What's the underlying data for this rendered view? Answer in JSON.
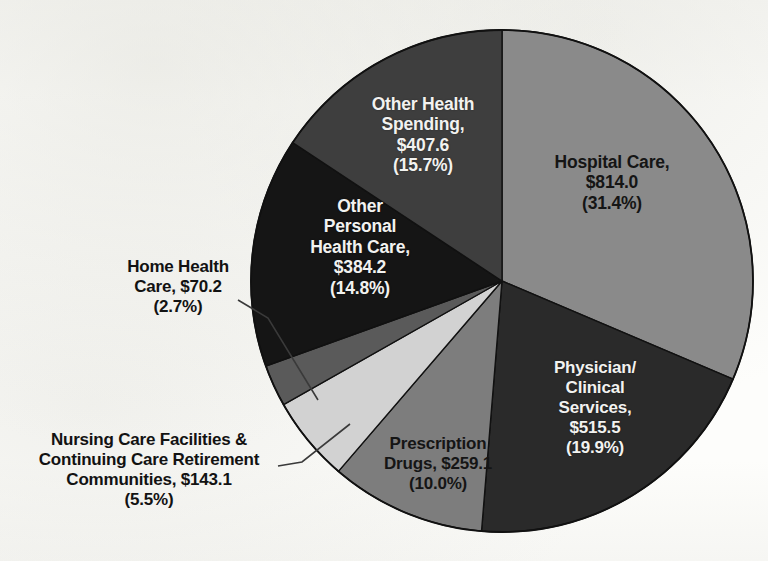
{
  "chart_data": {
    "type": "pie",
    "title": "",
    "subtitle": "",
    "units": "billions of dollars",
    "total": 2593.7,
    "legend": "none",
    "labels_position": "inside slices with external callouts for small slices",
    "start_angle_deg": 0,
    "direction": "clockwise",
    "categories": [
      "Hospital Care",
      "Physician/Clinical Services",
      "Prescription Drugs",
      "Nursing Care Facilities & Continuing Care Retirement Communities",
      "Home Health Care",
      "Other Personal Health Care",
      "Other Health Spending"
    ],
    "values": [
      814.0,
      515.5,
      259.1,
      143.1,
      70.2,
      384.2,
      407.6
    ],
    "percents": [
      31.4,
      19.9,
      10.0,
      5.5,
      2.7,
      14.8,
      15.7
    ],
    "colors": [
      "#8a8a8a",
      "#2a2a2a",
      "#7d7d7d",
      "#d2d2d2",
      "#5a5a5a",
      "#151515",
      "#3e3e3e"
    ]
  },
  "slices": {
    "hospital": {
      "name": "Hospital Care",
      "label": "Hospital Care,\n$814.0\n(31.4%)",
      "value": "$814.0",
      "percent": "(31.4%)",
      "color": "#8a8a8a"
    },
    "physician": {
      "name": "Physician/Clinical Services",
      "label": "Physician/\nClinical\nServices,\n$515.5\n(19.9%)",
      "value": "$515.5",
      "percent": "(19.9%)",
      "color": "#2a2a2a"
    },
    "prescription": {
      "name": "Prescription Drugs",
      "label": "Prescription\nDrugs, $259.1\n(10.0%)",
      "value": "$259.1",
      "percent": "(10.0%)",
      "color": "#7d7d7d"
    },
    "nursing": {
      "name": "Nursing Care Facilities & Continuing Care Retirement Communities",
      "label": "Nursing Care Facilities &\nContinuing Care Retirement\nCommunities, $143.1\n(5.5%)",
      "value": "$143.1",
      "percent": "(5.5%)",
      "color": "#d2d2d2"
    },
    "homehealth": {
      "name": "Home Health Care",
      "label": "Home Health\nCare, $70.2\n(2.7%)",
      "value": "$70.2",
      "percent": "(2.7%)",
      "color": "#5a5a5a"
    },
    "otherpersonal": {
      "name": "Other Personal Health Care",
      "label": "Other\nPersonal\nHealth Care,\n$384.2\n(14.8%)",
      "value": "$384.2",
      "percent": "(14.8%)",
      "color": "#151515"
    },
    "otherhealth": {
      "name": "Other Health Spending",
      "label": "Other Health\nSpending,\n$407.6\n(15.7%)",
      "value": "$407.6",
      "percent": "(15.7%)",
      "color": "#3e3e3e"
    }
  },
  "geometry": {
    "center_x": 502,
    "center_y": 281,
    "radius": 251,
    "outline_color": "#111111"
  }
}
